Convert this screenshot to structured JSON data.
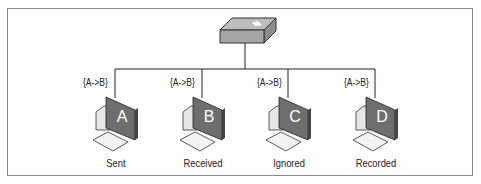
{
  "diagram": {
    "hub": {
      "name": "switch"
    },
    "hosts": [
      {
        "id": "A",
        "frame_label": "{A->B}",
        "caption": "Sent"
      },
      {
        "id": "B",
        "frame_label": "{A->B}",
        "caption": "Received"
      },
      {
        "id": "C",
        "frame_label": "{A->B}",
        "caption": "Ignored"
      },
      {
        "id": "D",
        "frame_label": "{A->B}",
        "caption": "Recorded"
      }
    ]
  }
}
